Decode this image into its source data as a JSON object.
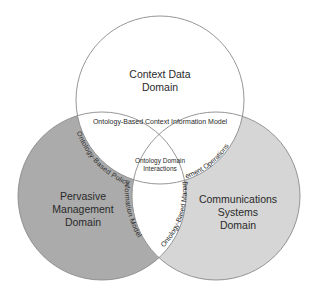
{
  "diagram": {
    "type": "venn",
    "colors": {
      "background": "#ffffff",
      "left_fill": "#ababab",
      "right_fill": "#d6d6d6",
      "top_fill": "#ffffff",
      "overlap_fill": "#ffffff",
      "stroke": "#8a8a8a",
      "text": "#2a2a2a"
    },
    "circles": {
      "top": {
        "label_line1": "Context Data",
        "label_line2": "Domain"
      },
      "left": {
        "label_line1": "Pervasive",
        "label_line2": "Management",
        "label_line3": "Domain"
      },
      "right": {
        "label_line1": "Communications",
        "label_line2": "Systems",
        "label_line3": "Domain"
      }
    },
    "overlaps": {
      "top_band": "Ontology-Based Context Information Model",
      "left_arc": "Ontology-Based Policy Information Model",
      "right_arc": "Ontology-Based Management Operations",
      "center_line1": "Ontology Domain",
      "center_line2": "Interactions"
    }
  }
}
